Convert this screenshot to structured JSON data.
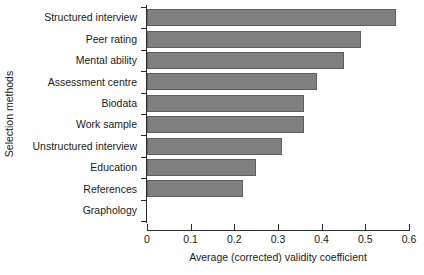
{
  "chart_data": {
    "type": "bar",
    "orientation": "horizontal",
    "title": "",
    "xlabel": "Average (corrected) validity coefficient",
    "ylabel": "Selection methods",
    "categories": [
      "Structured interview",
      "Peer rating",
      "Mental ability",
      "Assessment centre",
      "Biodata",
      "Work sample",
      "Unstructured interview",
      "Education",
      "References",
      "Graphology"
    ],
    "values": [
      0.57,
      0.49,
      0.45,
      0.39,
      0.36,
      0.36,
      0.31,
      0.25,
      0.22,
      0.0
    ],
    "xlim": [
      0,
      0.6
    ],
    "xticks": [
      0,
      0.1,
      0.2,
      0.3,
      0.4,
      0.5,
      0.6
    ],
    "xtick_labels": [
      "0",
      "0.1",
      "0.2",
      "0.3",
      "0.4",
      "0.5",
      "0.6"
    ],
    "grid": false,
    "legend": false,
    "bar_color": "#808080",
    "bar_edge_color": "#5e5e5e",
    "axis_color": "#2b2b2b"
  }
}
